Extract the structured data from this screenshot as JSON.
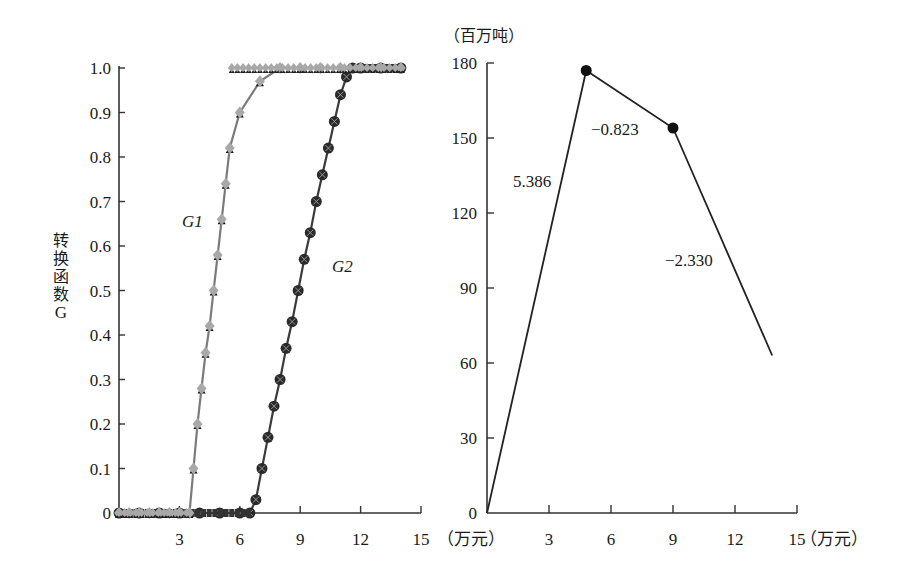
{
  "chart_data": [
    {
      "type": "line",
      "panel": "left",
      "title": "",
      "xlabel": "（万元）",
      "ylabel": "转换函数G",
      "xlim": [
        0,
        15
      ],
      "ylim": [
        0,
        1.0
      ],
      "x_ticks": [
        3,
        6,
        9,
        12,
        15
      ],
      "y_ticks": [
        0,
        0.1,
        0.2,
        0.3,
        0.4,
        0.5,
        0.6,
        0.7,
        0.8,
        0.9,
        1.0
      ],
      "y_tick_labels": [
        "0",
        "0.1",
        "0.2",
        "0.3",
        "0.4",
        "0.5",
        "0.6",
        "0.7",
        "0.8",
        "0.9",
        "1.0"
      ],
      "grid": false,
      "series": [
        {
          "name": "G1",
          "marker": "gray diamond + black triangle",
          "color": "#8a8a8a",
          "x": [
            0,
            0.5,
            1.0,
            1.5,
            2.0,
            2.5,
            3.0,
            3.5,
            3.7,
            3.9,
            4.1,
            4.3,
            4.5,
            4.7,
            4.9,
            5.1,
            5.3,
            5.5,
            6.0,
            7.0,
            8.0,
            9.0,
            10.0,
            11.0,
            12.0,
            13.0,
            14.0
          ],
          "values": [
            0,
            0,
            0,
            0,
            0,
            0,
            0,
            0,
            0.1,
            0.2,
            0.28,
            0.36,
            0.42,
            0.5,
            0.58,
            0.66,
            0.74,
            0.82,
            0.9,
            0.97,
            1.0,
            1.0,
            1.0,
            1.0,
            1.0,
            1.0,
            1.0
          ]
        },
        {
          "name": "G2",
          "marker": "black circle with x",
          "color": "#333333",
          "x": [
            0,
            1.0,
            2.0,
            3.0,
            4.0,
            5.0,
            6.0,
            6.5,
            6.8,
            7.1,
            7.4,
            7.7,
            8.0,
            8.3,
            8.6,
            8.9,
            9.2,
            9.5,
            9.8,
            10.1,
            10.4,
            10.7,
            11.0,
            11.3,
            11.6,
            12.0,
            13.0,
            14.0
          ],
          "values": [
            0,
            0,
            0,
            0,
            0,
            0,
            0,
            0,
            0.03,
            0.1,
            0.17,
            0.24,
            0.3,
            0.37,
            0.43,
            0.5,
            0.57,
            0.63,
            0.7,
            0.76,
            0.82,
            0.88,
            0.94,
            0.98,
            1.0,
            1.0,
            1.0,
            1.0
          ]
        }
      ],
      "annotations": [
        "G1",
        "G2"
      ]
    },
    {
      "type": "line",
      "panel": "right",
      "title": "",
      "xlabel": "（万元）",
      "ylabel": "（百万吨）",
      "xlim": [
        0,
        15
      ],
      "ylim": [
        0,
        180
      ],
      "x_ticks": [
        3,
        6,
        9,
        12,
        15
      ],
      "y_ticks": [
        0,
        30,
        60,
        90,
        120,
        150,
        180
      ],
      "grid": false,
      "series": [
        {
          "name": "piecewise",
          "x": [
            0,
            4.8,
            9.0,
            13.8
          ],
          "values": [
            0,
            177,
            154,
            63
          ],
          "marked_points": [
            1,
            2
          ]
        }
      ],
      "annotations": [
        {
          "text": "5.386",
          "segment": 1
        },
        {
          "text": "−0.823",
          "segment": 2
        },
        {
          "text": "−2.330",
          "segment": 3
        }
      ]
    }
  ],
  "labels": {
    "left_ylabel_chars": [
      "转",
      "换",
      "函",
      "数",
      "G"
    ],
    "left_xunit": "（万元）",
    "right_yunit": "（百万吨）",
    "right_xunit": "（万元）",
    "g1": "G1",
    "g2": "G2",
    "slope1": "5.386",
    "slope2": "−0.823",
    "slope3": "−2.330"
  }
}
